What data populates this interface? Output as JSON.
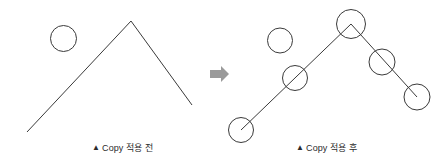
{
  "figure": {
    "background_color": "#ffffff",
    "stroke_color": "#3a3a3a",
    "width": 444,
    "height": 167
  },
  "panels": {
    "before": {
      "caption_marker": "▲",
      "caption_text": "Copy 적용 전",
      "source_circle": {
        "cx": 63.5,
        "cy": 38.5,
        "r": 13
      },
      "polyline_points": "27,132 131,21 192,105"
    },
    "after": {
      "caption_marker": "▲",
      "caption_text": "Copy 적용 후",
      "source_circle": {
        "cx": 280,
        "cy": 40.5,
        "r": 12.5
      },
      "polyline_points": "241,130 351,24 417,97",
      "copied_circles": [
        {
          "cx": 241,
          "cy": 130,
          "r": 12.5
        },
        {
          "cx": 295,
          "cy": 78,
          "r": 12.5
        },
        {
          "cx": 351,
          "cy": 24,
          "r": 14.5
        },
        {
          "cx": 382,
          "cy": 62,
          "r": 13
        },
        {
          "cx": 417,
          "cy": 97,
          "r": 13
        }
      ]
    }
  },
  "arrow": {
    "name": "right-arrow",
    "color": "#9a9a9a",
    "x": 210,
    "y": 66,
    "width": 19,
    "height": 16
  }
}
